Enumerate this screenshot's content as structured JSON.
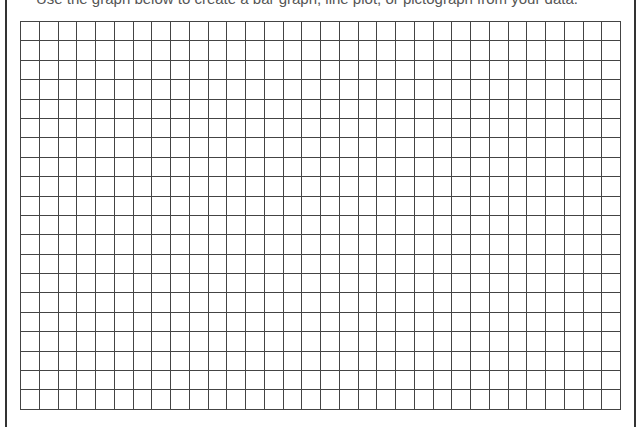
{
  "heading": {
    "text": "Use the graph below to create a bar graph, line plot, or pictograph from your data."
  },
  "grid": {
    "columns": 32,
    "rows": 20,
    "line_color": "#444444"
  }
}
